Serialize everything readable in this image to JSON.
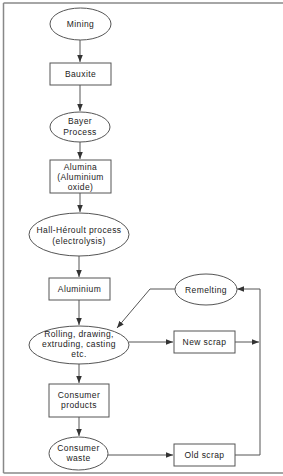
{
  "diagram": {
    "type": "flowchart",
    "colors": {
      "stroke": "#555555",
      "text": "#222222",
      "frame": "#888888",
      "background": "#ffffff"
    },
    "nodes": {
      "mining": {
        "shape": "ellipse",
        "lines": [
          "Mining"
        ]
      },
      "bauxite": {
        "shape": "rect",
        "lines": [
          "Bauxite"
        ]
      },
      "bayer": {
        "shape": "ellipse",
        "lines": [
          "Bayer",
          "Process"
        ]
      },
      "alumina": {
        "shape": "rect",
        "lines": [
          "Alumina",
          "(Aluminium",
          "oxide)"
        ]
      },
      "hall": {
        "shape": "ellipse",
        "lines": [
          "Hall-Héroult process",
          "(electrolysis)"
        ]
      },
      "aluminium": {
        "shape": "rect",
        "lines": [
          "Aluminium"
        ]
      },
      "rolling": {
        "shape": "ellipse",
        "lines": [
          "Rolling, drawing,",
          "extruding, casting",
          "etc."
        ]
      },
      "remelting": {
        "shape": "ellipse",
        "lines": [
          "Remelting"
        ]
      },
      "new_scrap": {
        "shape": "rect",
        "lines": [
          "New scrap"
        ]
      },
      "consumer_products": {
        "shape": "rect",
        "lines": [
          "Consumer",
          "products"
        ]
      },
      "consumer_waste": {
        "shape": "ellipse",
        "lines": [
          "Consumer",
          "waste"
        ]
      },
      "old_scrap": {
        "shape": "rect",
        "lines": [
          "Old scrap"
        ]
      }
    },
    "edges": [
      {
        "from": "Mining",
        "to": "Bauxite"
      },
      {
        "from": "Bauxite",
        "to": "Bayer Process"
      },
      {
        "from": "Bayer Process",
        "to": "Alumina (Aluminium oxide)"
      },
      {
        "from": "Alumina (Aluminium oxide)",
        "to": "Hall-Héroult process (electrolysis)"
      },
      {
        "from": "Hall-Héroult process (electrolysis)",
        "to": "Aluminium"
      },
      {
        "from": "Aluminium",
        "to": "Rolling, drawing, extruding, casting etc."
      },
      {
        "from": "Rolling, drawing, extruding, casting etc.",
        "to": "New scrap"
      },
      {
        "from": "New scrap",
        "to": "Remelting"
      },
      {
        "from": "Rolling, drawing, extruding, casting etc.",
        "to": "Consumer products"
      },
      {
        "from": "Consumer products",
        "to": "Consumer waste"
      },
      {
        "from": "Consumer waste",
        "to": "Old scrap"
      },
      {
        "from": "Old scrap",
        "to": "Remelting"
      },
      {
        "from": "Remelting",
        "to": "Rolling, drawing, extruding, casting etc."
      }
    ]
  }
}
